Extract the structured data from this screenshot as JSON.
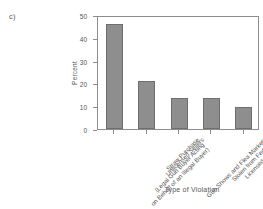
{
  "panel": {
    "label": "c)"
  },
  "chart_data": {
    "type": "bar",
    "title": "",
    "subtitle": "",
    "xlabel": "Type of Violation",
    "ylabel": "Percent",
    "ylim": [
      0,
      50
    ],
    "yticks": [
      0,
      10,
      20,
      30,
      40,
      50
    ],
    "ytick_labels": [
      "0",
      "10",
      "20",
      "30",
      "40",
      "50"
    ],
    "grid": false,
    "legend": "none",
    "bar_color": "#8e8e8e",
    "bar_edge_color": "#6e6e6e",
    "categories": [
      "Straw Purchase (Legal Gun Buyer Acting on Behalf of an Illegal Buyer)",
      "Unlicensed Sellers",
      "Gun Shows and Flea Markets",
      "Stolen from Federally Licensed Dealers",
      "Stolen from Residences"
    ],
    "category_lines": [
      [
        "Straw Purchase",
        "(Legal Gun Buyer Acting",
        "on Behalf of an Illegal Buyer)"
      ],
      [
        "Unlicensed Sellers"
      ],
      [
        "Gun Shows and Flea Markets"
      ],
      [
        "Stolen from Federally",
        "Licensed Dealers"
      ],
      [
        "Stolen from Residences"
      ]
    ],
    "values": [
      46,
      21,
      13.7,
      13.7,
      9.7
    ]
  }
}
